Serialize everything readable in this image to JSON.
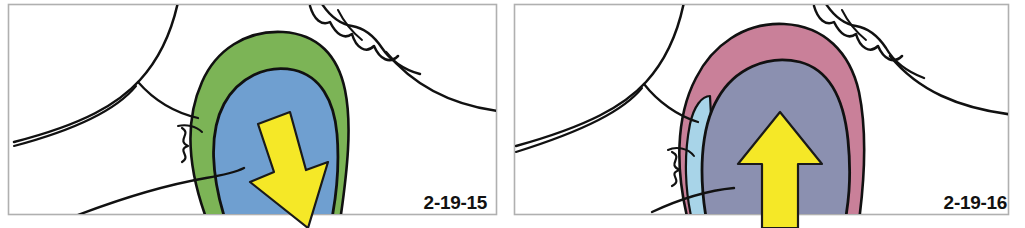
{
  "figure": {
    "panel_count": 2,
    "background_color": "#ffffff",
    "frame_color": "#b0b0b0"
  },
  "panels": [
    {
      "id": "panel-left",
      "label": "2-19-15",
      "label_name": "figure-label-2-19-15",
      "arrow": {
        "icon": "arrow-down-right-icon",
        "direction": "down-right",
        "color": "#f5e827",
        "outline_color": "#1a1a1a"
      },
      "regions": [
        {
          "name": "green-outer-region",
          "color": "#7cb456",
          "label": "green outer layer"
        },
        {
          "name": "blue-inner-region",
          "color": "#6f9fd0",
          "label": "blue inner mass"
        }
      ],
      "line_art_color": "#111111"
    },
    {
      "id": "panel-right",
      "label": "2-19-16",
      "label_name": "figure-label-2-19-16",
      "arrow": {
        "icon": "arrow-up-icon",
        "direction": "up",
        "color": "#f5e827",
        "outline_color": "#1a1a1a"
      },
      "regions": [
        {
          "name": "pink-outer-region",
          "color": "#c98099",
          "label": "pink outer layer"
        },
        {
          "name": "slate-inner-region",
          "color": "#8b90b0",
          "label": "slate inner mass"
        },
        {
          "name": "lightblue-sliver-region",
          "color": "#a8d4e8",
          "label": "light blue sliver"
        }
      ],
      "line_art_color": "#111111"
    }
  ],
  "colors": {
    "green": "#7cb456",
    "blue": "#6f9fd0",
    "pink": "#c98099",
    "slate": "#8b90b0",
    "lightblue": "#a8d4e8",
    "yellow": "#f5e827",
    "ink": "#111111",
    "frame": "#b0b0b0",
    "page_edge": "#d8d8d8"
  }
}
